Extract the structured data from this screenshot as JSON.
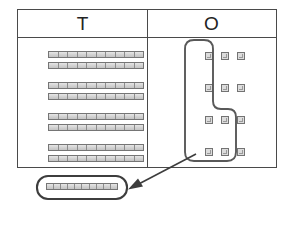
{
  "diagram": {
    "type": "base-ten-blocks",
    "colors": {
      "line": "#4a4a4a",
      "lasso": "#595959",
      "block_fill": "#d9d9d9",
      "block_stroke": "#757575",
      "background": "#ffffff"
    }
  },
  "table": {
    "columns": [
      {
        "key": "tens",
        "label": "T",
        "name": "tens"
      },
      {
        "key": "ones",
        "label": "O",
        "name": "ones"
      }
    ]
  },
  "tens_column": {
    "label": "T",
    "rod_count": 8,
    "segments_per_rod": 10,
    "rows": [
      {
        "rods": 2
      },
      {
        "rods": 2
      },
      {
        "rods": 2
      },
      {
        "rods": 2
      }
    ],
    "rods": [
      {
        "index": 1,
        "x": 30,
        "y": 13,
        "segments": 10
      },
      {
        "index": 2,
        "x": 30,
        "y": 24,
        "segments": 10
      },
      {
        "index": 3,
        "x": 30,
        "y": 44,
        "segments": 10
      },
      {
        "index": 4,
        "x": 30,
        "y": 55,
        "segments": 10
      },
      {
        "index": 5,
        "x": 30,
        "y": 75,
        "segments": 10
      },
      {
        "index": 6,
        "x": 30,
        "y": 86,
        "segments": 10
      },
      {
        "index": 7,
        "x": 30,
        "y": 106,
        "segments": 10
      },
      {
        "index": 8,
        "x": 30,
        "y": 117,
        "segments": 10
      }
    ]
  },
  "ones_column": {
    "label": "O",
    "cube_count": 12,
    "grid_rows": 4,
    "grid_cols": 3,
    "circled_count": 10,
    "cubes": [
      {
        "index": 1,
        "row": 1,
        "col": 1,
        "x": 58,
        "y": 14,
        "circled": true
      },
      {
        "index": 2,
        "row": 1,
        "col": 2,
        "x": 74,
        "y": 14,
        "circled": true
      },
      {
        "index": 3,
        "row": 1,
        "col": 3,
        "x": 90,
        "y": 14,
        "circled": false
      },
      {
        "index": 4,
        "row": 2,
        "col": 1,
        "x": 58,
        "y": 46,
        "circled": true
      },
      {
        "index": 5,
        "row": 2,
        "col": 2,
        "x": 74,
        "y": 46,
        "circled": true
      },
      {
        "index": 6,
        "row": 2,
        "col": 3,
        "x": 90,
        "y": 46,
        "circled": false
      },
      {
        "index": 7,
        "row": 3,
        "col": 1,
        "x": 58,
        "y": 78,
        "circled": true
      },
      {
        "index": 8,
        "row": 3,
        "col": 2,
        "x": 74,
        "y": 78,
        "circled": true
      },
      {
        "index": 9,
        "row": 3,
        "col": 3,
        "x": 90,
        "y": 78,
        "circled": true
      },
      {
        "index": 10,
        "row": 4,
        "col": 1,
        "x": 58,
        "y": 110,
        "circled": true
      },
      {
        "index": 11,
        "row": 4,
        "col": 2,
        "x": 74,
        "y": 110,
        "circled": true
      },
      {
        "index": 12,
        "row": 4,
        "col": 3,
        "x": 90,
        "y": 110,
        "circled": true
      }
    ]
  },
  "lasso": {
    "name": "ones-selection-lasso",
    "encircles": 10,
    "shape": "stepped-rounded-outline"
  },
  "arrow": {
    "name": "regroup-arrow",
    "from": {
      "x": 196,
      "y": 154
    },
    "to": {
      "x": 130,
      "y": 188
    },
    "direction": "down-left"
  },
  "result": {
    "name": "regrouped-ten-rod",
    "segments": 10,
    "circled": true,
    "description": "one ten rod"
  }
}
